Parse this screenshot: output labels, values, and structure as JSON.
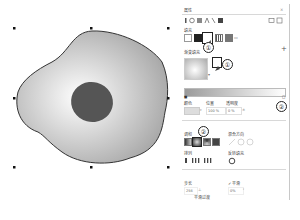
{
  "panel": {
    "title": "属性",
    "close_label": "×",
    "section_fill": "填充",
    "section_fountain": "渐变填充",
    "color_label": "颜色",
    "position_label": "位置",
    "transparency_label": "透明度",
    "position_value": "100 %",
    "transparency_value": "0 %",
    "blend_label": "调和",
    "blend_direction_label": "混合方向",
    "mode_label": "排列",
    "reverse_label": "反转填充",
    "steps_label": "步长",
    "steps_value": "256",
    "smooth_label": "平滑",
    "smooth_checked": true,
    "acceleration_value": "0%",
    "free_scale_label": "平滑过渡",
    "callouts": [
      "①",
      "①",
      "②",
      "②"
    ],
    "colors": {
      "accent_border": "#222222",
      "ramp_start": "#9a9a9a",
      "ramp_end": "#ffffff"
    }
  },
  "canvas": {
    "shape": "blob-with-radial-fountain-fill",
    "fill_center": "#ffffff",
    "fill_edge": "#a9a9a9",
    "inner_ellipse_color": "#555555",
    "outline_color": "#333333"
  }
}
